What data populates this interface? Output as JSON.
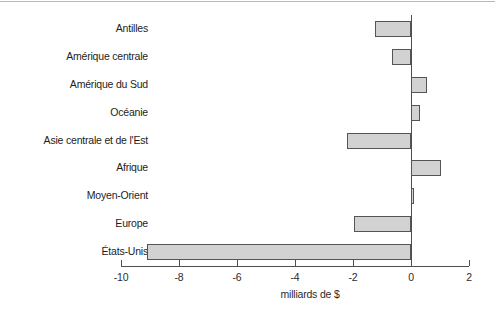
{
  "chart_data": {
    "type": "bar",
    "orientation": "horizontal",
    "title": "",
    "subtitle": "",
    "xlabel": "milliards de $",
    "ylabel": "",
    "xlim": [
      -10,
      2
    ],
    "xticks": [
      -10,
      -8,
      -6,
      -4,
      -2,
      0,
      2
    ],
    "xtick_labels": [
      "-10",
      "-8",
      "-6",
      "-4",
      "-2",
      "0",
      "2"
    ],
    "grid": false,
    "legend": null,
    "categories": [
      "Antilles",
      "Amérique centrale",
      "Amérique du Sud",
      "Océanie",
      "Asie centrale et de l'Est",
      "Afrique",
      "Moyen-Orient",
      "Europe",
      "États-Unis"
    ],
    "values": [
      -1.25,
      -0.65,
      0.55,
      0.3,
      -2.2,
      1.05,
      0.1,
      -1.95,
      -9.1
    ],
    "bar_fill_color": "#d2d2d2",
    "bar_edge_color": "#555555",
    "axis_color": "#4f4f4f"
  }
}
